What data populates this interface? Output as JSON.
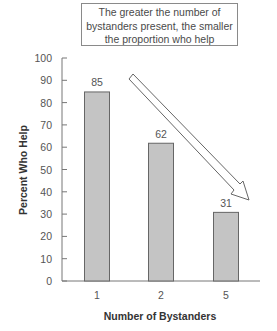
{
  "chart_data": {
    "type": "bar",
    "title": "",
    "annotation": "The greater the number of bystanders present, the smaller the proportion who help",
    "annotation_lines": [
      "The greater the number of",
      "bystanders present, the smaller",
      "the proportion who help"
    ],
    "xlabel": "Number of Bystanders",
    "ylabel": "Percent Who Help",
    "categories": [
      "1",
      "2",
      "5"
    ],
    "values": [
      85,
      62,
      31
    ],
    "data_labels": [
      "85",
      "62",
      "31"
    ],
    "ylim": [
      0,
      100
    ],
    "yticks": [
      0,
      10,
      20,
      30,
      40,
      50,
      60,
      70,
      80,
      90,
      100
    ],
    "grid": false,
    "legend": null,
    "bar_color": "#c4c4c4",
    "trend_arrow": "hollow arrow pointing down-right indicating decrease"
  }
}
